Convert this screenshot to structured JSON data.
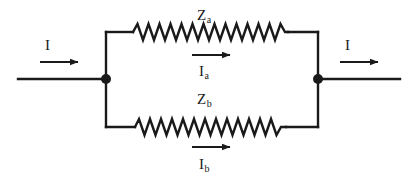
{
  "diagram": {
    "type": "electrical-circuit-schematic",
    "background_color": "#ffffff",
    "stroke_color": "#1a1a1a",
    "labels": {
      "impedance_a": {
        "base": "Z",
        "sub": "a"
      },
      "impedance_b": {
        "base": "Z",
        "sub": "b"
      },
      "current_a": {
        "base": "I",
        "sub": "a"
      },
      "current_b": {
        "base": "I",
        "sub": "b"
      },
      "current_in": {
        "base": "I",
        "sub": ""
      },
      "current_out": {
        "base": "I",
        "sub": ""
      }
    },
    "components": [
      {
        "name": "resistor-za",
        "kind": "resistor-zigzag",
        "branch": "upper",
        "zigzags": 14
      },
      {
        "name": "resistor-zb",
        "kind": "resistor-zigzag",
        "branch": "lower",
        "zigzags": 14
      },
      {
        "name": "node-left",
        "kind": "junction-dot"
      },
      {
        "name": "node-right",
        "kind": "junction-dot"
      }
    ],
    "arrows": [
      {
        "name": "arrow-current-in",
        "direction": "right"
      },
      {
        "name": "arrow-current-out",
        "direction": "right"
      },
      {
        "name": "arrow-current-a",
        "direction": "right"
      },
      {
        "name": "arrow-current-b",
        "direction": "right"
      }
    ]
  }
}
